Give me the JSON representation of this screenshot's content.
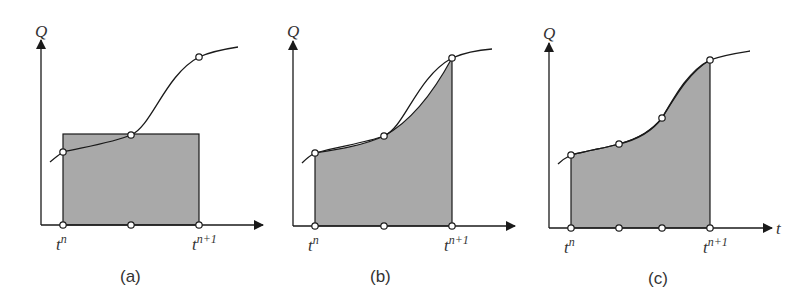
{
  "figure": {
    "panels": [
      {
        "id": "a",
        "caption": "(a)",
        "y_axis_label": "Q",
        "x_tick_start": "t",
        "x_tick_start_sup": "n",
        "x_tick_end": "t",
        "x_tick_end_sup": "n+1",
        "method": "midpoint rectangle"
      },
      {
        "id": "b",
        "caption": "(b)",
        "y_axis_label": "Q",
        "x_tick_start": "t",
        "x_tick_start_sup": "n",
        "x_tick_end": "t",
        "x_tick_end_sup": "n+1",
        "method": "quadratic (Simpson) through 3 points"
      },
      {
        "id": "c",
        "caption": "(c)",
        "y_axis_label": "Q",
        "x_axis_label": "t",
        "x_tick_start": "t",
        "x_tick_start_sup": "n",
        "x_tick_end": "t",
        "x_tick_end_sup": "n+1",
        "method": "cubic through 4 points"
      }
    ],
    "colors": {
      "fill": "#a9a9a9",
      "line": "#1a1a1a",
      "background": "#ffffff"
    }
  }
}
